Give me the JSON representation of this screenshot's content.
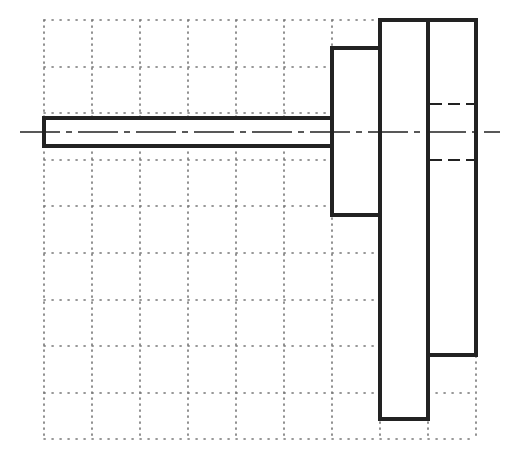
{
  "diagram": {
    "title": "Stepped shaft with hub and discs on dotted grid",
    "colors": {
      "background": "#ffffff",
      "outline": "#222222",
      "grid": "#777777",
      "centerline": "#222222"
    },
    "grid": {
      "x_lines": [
        44,
        92,
        140,
        188,
        236,
        284,
        332,
        380,
        428,
        476
      ],
      "y_lines": [
        20,
        67,
        113,
        160,
        206,
        253,
        300,
        346,
        393,
        439
      ],
      "style": "dotted"
    },
    "centerline": {
      "y": 132,
      "x1": 20,
      "x2": 500,
      "style": "dash-dot"
    },
    "parts": [
      {
        "name": "shaft",
        "x": 44,
        "y": 118,
        "w": 288,
        "h": 28
      },
      {
        "name": "hub",
        "x": 332,
        "y": 48,
        "w": 48,
        "h": 167
      },
      {
        "name": "disc-1",
        "x": 380,
        "y": 20,
        "w": 48,
        "h": 399
      },
      {
        "name": "disc-2",
        "x": 428,
        "y": 20,
        "w": 48,
        "h": 335
      }
    ],
    "hidden_lines": [
      {
        "name": "bore-top",
        "x1": 430,
        "x2": 474,
        "y": 104
      },
      {
        "name": "bore-bottom",
        "x1": 430,
        "x2": 474,
        "y": 160
      }
    ]
  }
}
